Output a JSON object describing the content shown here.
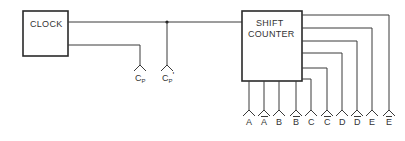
{
  "diagram": {
    "type": "block-diagram",
    "blocks": [
      {
        "id": "clock",
        "label_lines": [
          "CLOCK"
        ]
      },
      {
        "id": "shift_counter",
        "label_lines": [
          "SHIFT",
          "COUNTER"
        ]
      }
    ],
    "clock_outputs": [
      {
        "id": "cp",
        "base": "C",
        "sub": "P",
        "prime": ""
      },
      {
        "id": "cp_prime",
        "base": "C",
        "sub": "P",
        "prime": "'"
      }
    ],
    "counter_outputs": [
      {
        "label": "A",
        "overbar": false
      },
      {
        "label": "A",
        "overbar": true
      },
      {
        "label": "B",
        "overbar": false
      },
      {
        "label": "B",
        "overbar": true
      },
      {
        "label": "C",
        "overbar": false
      },
      {
        "label": "C",
        "overbar": true
      },
      {
        "label": "D",
        "overbar": false
      },
      {
        "label": "D",
        "overbar": true
      },
      {
        "label": "E",
        "overbar": false
      },
      {
        "label": "E",
        "overbar": true
      }
    ],
    "connections": [
      "CLOCK -> SHIFT COUNTER (junction to Cp')",
      "CLOCK -> Cp"
    ],
    "colors": {
      "line": "#3a3a3a",
      "text": "#333333",
      "background": "#ffffff"
    }
  }
}
